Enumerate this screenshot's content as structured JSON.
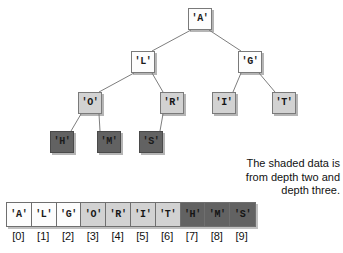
{
  "figure": {
    "colors": {
      "node_white": "#fdfdfd",
      "node_light_shade": "#d2d2d2",
      "node_dark_shade": "#626262",
      "border": "#7a7a7a",
      "text": "#111111",
      "background": "#ffffff"
    }
  },
  "tree": {
    "nodes": [
      {
        "id": "n0",
        "label": "'A'",
        "depth": 0,
        "shade": "white",
        "x": 188,
        "y": 8
      },
      {
        "id": "n1",
        "label": "'L'",
        "depth": 1,
        "shade": "white",
        "x": 131,
        "y": 51
      },
      {
        "id": "n2",
        "label": "'G'",
        "depth": 1,
        "shade": "white",
        "x": 238,
        "y": 51
      },
      {
        "id": "n3",
        "label": "'O'",
        "depth": 2,
        "shade": "light",
        "x": 78,
        "y": 92
      },
      {
        "id": "n4",
        "label": "'R'",
        "depth": 2,
        "shade": "light",
        "x": 160,
        "y": 92
      },
      {
        "id": "n5",
        "label": "'I'",
        "depth": 2,
        "shade": "light",
        "x": 212,
        "y": 92
      },
      {
        "id": "n6",
        "label": "'T'",
        "depth": 2,
        "shade": "light",
        "x": 272,
        "y": 92
      },
      {
        "id": "n7",
        "label": "'H'",
        "depth": 3,
        "shade": "dark",
        "x": 50,
        "y": 131
      },
      {
        "id": "n8",
        "label": "'M'",
        "depth": 3,
        "shade": "dark",
        "x": 97,
        "y": 131
      },
      {
        "id": "n9",
        "label": "'S'",
        "depth": 3,
        "shade": "dark",
        "x": 139,
        "y": 131
      }
    ],
    "edges": [
      {
        "from": "n0",
        "to": "n1"
      },
      {
        "from": "n0",
        "to": "n2"
      },
      {
        "from": "n1",
        "to": "n3"
      },
      {
        "from": "n1",
        "to": "n4"
      },
      {
        "from": "n2",
        "to": "n5"
      },
      {
        "from": "n2",
        "to": "n6"
      },
      {
        "from": "n3",
        "to": "n7"
      },
      {
        "from": "n3",
        "to": "n8"
      },
      {
        "from": "n4",
        "to": "n9"
      }
    ]
  },
  "caption": {
    "lines": [
      "The shaded data is",
      "from depth two and",
      "depth three."
    ]
  },
  "array": {
    "cells": [
      {
        "value": "'A'",
        "index": "[0]",
        "shade": "white"
      },
      {
        "value": "'L'",
        "index": "[1]",
        "shade": "white"
      },
      {
        "value": "'G'",
        "index": "[2]",
        "shade": "white"
      },
      {
        "value": "'O'",
        "index": "[3]",
        "shade": "light"
      },
      {
        "value": "'R'",
        "index": "[4]",
        "shade": "light"
      },
      {
        "value": "'I'",
        "index": "[5]",
        "shade": "light"
      },
      {
        "value": "'T'",
        "index": "[6]",
        "shade": "light"
      },
      {
        "value": "'H'",
        "index": "[7]",
        "shade": "dark"
      },
      {
        "value": "'M'",
        "index": "[8]",
        "shade": "dark"
      },
      {
        "value": "'S'",
        "index": "[9]",
        "shade": "dark"
      }
    ]
  }
}
